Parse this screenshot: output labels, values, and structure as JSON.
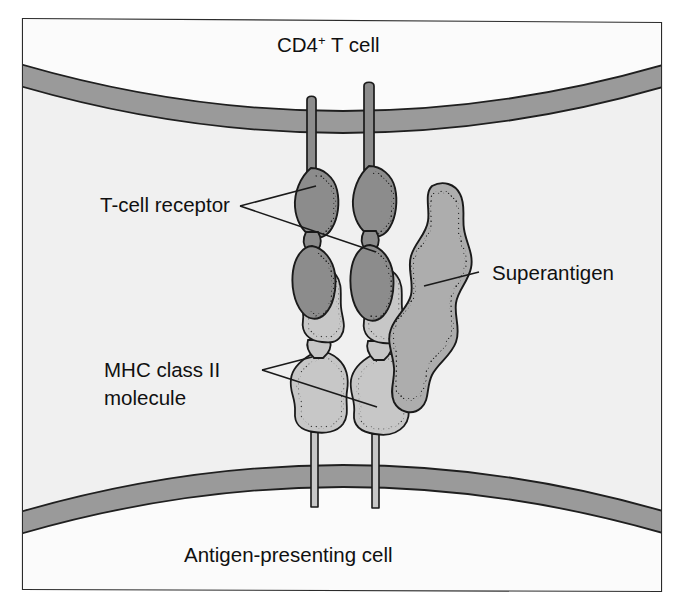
{
  "figure": {
    "background_color": "#ffffff",
    "frame": {
      "border_color": "#2b2b2b",
      "fill_color": "#f2f2f2"
    },
    "cells": {
      "top_cell": {
        "label": "CD4",
        "label_superscript": "+",
        "label_suffix": " T cell",
        "full_label": "CD4+ T cell",
        "cytoplasm_color": "#fbfbfb",
        "membrane_color": "#999999",
        "membrane_outline_color": "#1f1f1f"
      },
      "bottom_cell": {
        "label": "Antigen-presenting cell",
        "cytoplasm_color": "#fbfbfb",
        "membrane_color": "#999999",
        "membrane_outline_color": "#1f1f1f"
      },
      "intercellular_space_color": "#f0f0f0"
    },
    "molecules": [
      {
        "name": "T-cell receptor",
        "label": "T-cell receptor",
        "count": 2,
        "fill_color": "#8c8c8c",
        "outline_color": "#1a1a1a",
        "stipple_color": "#2a2a2a",
        "belongs_to": "CD4+ T cell"
      },
      {
        "name": "MHC class II molecule",
        "label_line_1": "MHC class II",
        "label_line_2": "molecule",
        "label": "MHC class II molecule",
        "count": 2,
        "fill_color": "#c7c7c7",
        "outline_color": "#1a1a1a",
        "stipple_color": "#3a3a3a",
        "belongs_to": "Antigen-presenting cell"
      },
      {
        "name": "Superantigen",
        "label": "Superantigen",
        "count": 1,
        "fill_color": "#adadad",
        "outline_color": "#1a1a1a",
        "stipple_color": "#2f2f2f",
        "belongs_to": "bridges TCR and MHC class II"
      }
    ],
    "leader_lines": {
      "color": "#1a1a1a",
      "width": 1.6
    }
  }
}
